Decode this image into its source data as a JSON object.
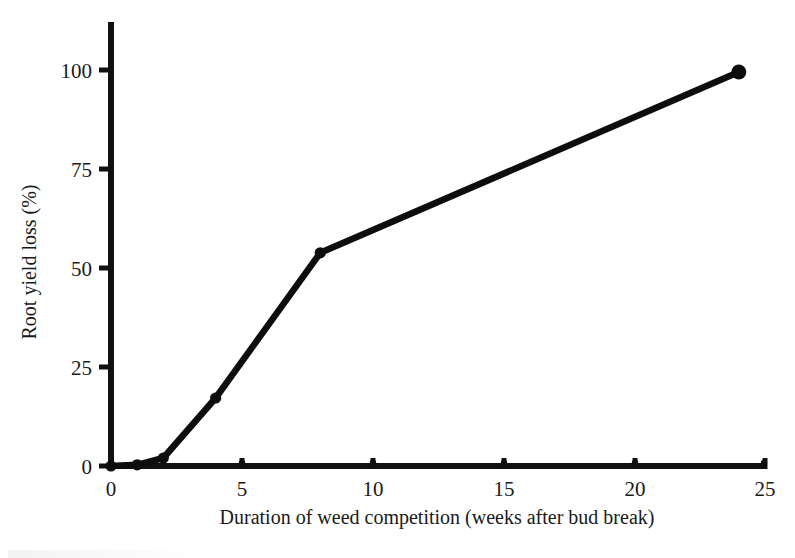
{
  "figure": {
    "background_color": "#ffffff",
    "ink_color": "#0d0d0d"
  },
  "chart_data": {
    "type": "line",
    "title": "",
    "xlabel": "Duration of weed competition (weeks after bud break)",
    "ylabel": "Root yield loss (%)",
    "xlim": [
      0,
      25
    ],
    "ylim": [
      0,
      111
    ],
    "xticks": [
      0,
      5,
      10,
      15,
      20,
      25
    ],
    "xtick_labels": [
      "0",
      "5",
      "10",
      "15",
      "20",
      "25"
    ],
    "yticks": [
      0,
      25,
      50,
      75,
      100
    ],
    "ytick_labels": [
      "0",
      "25",
      "50",
      "75",
      "100"
    ],
    "grid": false,
    "legend": false,
    "legend_position": "none",
    "series": [
      {
        "name": "Root yield loss",
        "marker": "circle",
        "color": "#0d0d0d",
        "x": [
          0,
          1,
          2,
          4,
          8,
          24
        ],
        "y": [
          0,
          0.3,
          2.0,
          17.0,
          53.3,
          98.5
        ]
      }
    ],
    "axis_ticks_x_direction": "inward",
    "axis_ticks_y_direction": "outward"
  }
}
